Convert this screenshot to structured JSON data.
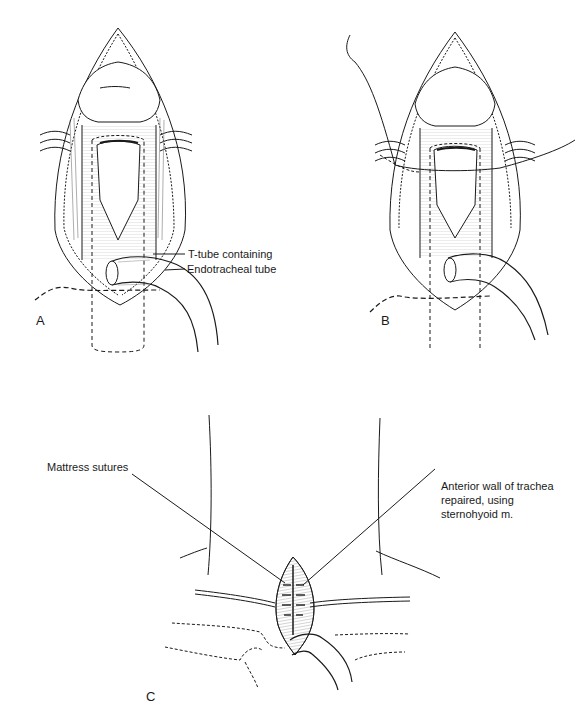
{
  "figure": {
    "panels": [
      {
        "id": "A",
        "letter": "A",
        "labels": {
          "ttube": "T-tube containing",
          "ett": "Endotracheal tube"
        }
      },
      {
        "id": "B",
        "letter": "B"
      },
      {
        "id": "C",
        "letter": "C",
        "labels": {
          "mattress": "Mattress sutures",
          "anterior_1": "Anterior wall of trachea",
          "anterior_2": "repaired, using",
          "anterior_3": "sternohyoid m."
        }
      }
    ],
    "colors": {
      "ink": "#1a1a1a",
      "background": "#ffffff",
      "shade": "#9a9a9a"
    }
  }
}
